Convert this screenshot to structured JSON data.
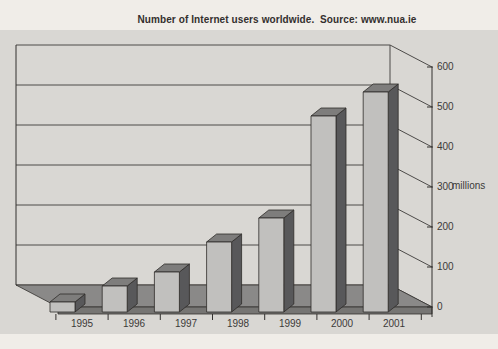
{
  "title": "Number of Internet users worldwide.  Source: www.nua.ie",
  "chart_data": {
    "type": "bar",
    "style": "3d-column",
    "title": "Number of Internet users worldwide.  Source: www.nua.ie",
    "categories": [
      "1995",
      "1996",
      "1997",
      "1998",
      "1999",
      "2000",
      "2001"
    ],
    "values": [
      25,
      65,
      100,
      175,
      235,
      490,
      550
    ],
    "series_name": "Internet users worldwide",
    "xlabel": "",
    "ylabel": "millions",
    "ylim": [
      0,
      600
    ],
    "ytick_step": 100,
    "grid": true,
    "legend": false,
    "source": "www.nua.ie"
  },
  "axis": {
    "y": {
      "ticks": [
        "600",
        "500",
        "400",
        "300",
        "200",
        "100",
        "0"
      ],
      "unit": "millions",
      "position": "right"
    },
    "x": {
      "categories": [
        "1995",
        "1996",
        "1997",
        "1998",
        "1999",
        "2000",
        "2001"
      ]
    }
  },
  "colors": {
    "page_bg": "#f0ede8",
    "panel_bg": "#d9d7d3",
    "grid_line": "#4d4b49",
    "axis_line": "#33312f",
    "floor_top": "#8a8988",
    "floor_front": "#767573",
    "bar_front": "#c1c0be",
    "bar_side": "#58585a",
    "bar_top": "#7e7d7c",
    "bar_stroke": "#2e2c2a",
    "text": "#3c3a38"
  }
}
